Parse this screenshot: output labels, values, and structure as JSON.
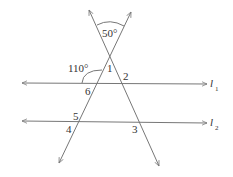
{
  "diagram": {
    "angles": {
      "top": "50°",
      "left": "110°"
    },
    "angle_numbers": [
      "1",
      "2",
      "3",
      "4",
      "5",
      "6"
    ],
    "lines": {
      "l1": {
        "letter": "l",
        "subscript": "1"
      },
      "l2": {
        "letter": "l",
        "subscript": "2"
      }
    }
  }
}
